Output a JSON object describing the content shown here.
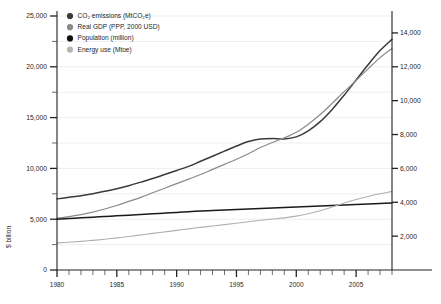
{
  "chart_data": {
    "type": "line",
    "title": "",
    "subtitle": "",
    "xlabel": "",
    "ylabel": "$ billion",
    "ylabel_right": "",
    "grid": true,
    "legend_position": "top-left",
    "xlim": [
      1980,
      2008
    ],
    "ylim": [
      0,
      25000
    ],
    "ylim_right": [
      0,
      15000
    ],
    "x_tick_labels": [
      "1980",
      "1985",
      "1990",
      "1995",
      "2000",
      "2005"
    ],
    "x_tick_values": [
      1980,
      1985,
      1990,
      1995,
      2000,
      2005
    ],
    "x_minor_step": 1,
    "y_tick_labels_left": [
      "0",
      "5,000",
      "10,000",
      "15,000",
      "20,000",
      "25,000"
    ],
    "y_tick_values_left": [
      0,
      5000,
      10000,
      15000,
      20000,
      25000
    ],
    "y_minor_values_left": [
      2500,
      7500,
      12500,
      17500,
      22500
    ],
    "y_tick_labels_right": [
      "2,000",
      "4,000",
      "6,000",
      "8,000",
      "10,000",
      "12,000",
      "14,000"
    ],
    "y_tick_values_right": [
      2000,
      4000,
      6000,
      8000,
      10000,
      12000,
      14000
    ],
    "x": [
      1980,
      1981,
      1982,
      1983,
      1984,
      1985,
      1986,
      1987,
      1988,
      1989,
      1990,
      1991,
      1992,
      1993,
      1994,
      1995,
      1996,
      1997,
      1998,
      1999,
      2000,
      2001,
      2002,
      2003,
      2004,
      2005,
      2006,
      2007,
      2008
    ],
    "series": [
      {
        "name": "CO2 emissions (MtCO2e)",
        "axis": "left",
        "color": "#3a3a3a",
        "values": [
          7000,
          7150,
          7300,
          7500,
          7750,
          8000,
          8300,
          8650,
          9000,
          9400,
          9800,
          10200,
          10700,
          11200,
          11700,
          12200,
          12650,
          12900,
          12950,
          12900,
          13100,
          13700,
          14600,
          15800,
          17200,
          18700,
          20200,
          21600,
          22700
        ]
      },
      {
        "name": "Real GDP (PPP, 2000 USD)",
        "axis": "left",
        "color": "#8a8a8a",
        "values": [
          5100,
          5250,
          5450,
          5700,
          6000,
          6350,
          6750,
          7150,
          7600,
          8050,
          8500,
          8950,
          9400,
          9900,
          10400,
          10900,
          11450,
          12050,
          12550,
          13000,
          13550,
          14350,
          15300,
          16400,
          17550,
          18650,
          19800,
          20900,
          21800
        ]
      },
      {
        "name": "Population (million)",
        "axis": "right",
        "color": "#1a1a1a",
        "values": [
          3000,
          3040,
          3080,
          3120,
          3160,
          3200,
          3240,
          3280,
          3320,
          3360,
          3400,
          3440,
          3480,
          3510,
          3540,
          3570,
          3600,
          3630,
          3660,
          3690,
          3720,
          3750,
          3780,
          3810,
          3840,
          3870,
          3900,
          3930,
          3960
        ]
      },
      {
        "name": "Energy use (Mtoe)",
        "axis": "right",
        "color": "#b0b0b0",
        "values": [
          1600,
          1640,
          1690,
          1750,
          1820,
          1900,
          1980,
          2070,
          2160,
          2250,
          2340,
          2430,
          2520,
          2600,
          2680,
          2760,
          2850,
          2940,
          3010,
          3080,
          3180,
          3320,
          3500,
          3720,
          3960,
          4160,
          4340,
          4500,
          4640
        ]
      }
    ],
    "legend": [
      {
        "label": "CO₂ emissions (MtCO₂e)",
        "color": "#3a3a3a"
      },
      {
        "label": "Real GDP (PPP, 2000 USD)",
        "color": "#8a8a8a"
      },
      {
        "label": "Population (million)",
        "color": "#0f0f0f"
      },
      {
        "label": "Energy use (Mtoe)",
        "color": "#b5b5b5"
      }
    ]
  },
  "axes": {
    "left_title": "$ billion"
  }
}
